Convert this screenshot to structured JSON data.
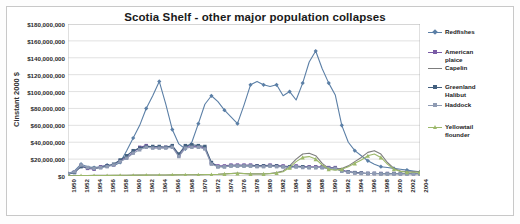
{
  "chart_data": {
    "type": "line",
    "title": "Scotia Shelf - other major population collapses",
    "xlabel": "",
    "ylabel": "Cinstant 2000 $",
    "ylim": [
      0,
      180000000
    ],
    "ytick_labels": [
      "$180,000,000",
      "$160,000,000",
      "$140,000,000",
      "$120,000,000",
      "$100,000,000",
      "$80,000,000",
      "$60,000,000",
      "$40,000,000",
      "$20,000,000",
      "$0"
    ],
    "ytick_values": [
      180000000,
      160000000,
      140000000,
      120000000,
      100000000,
      80000000,
      60000000,
      40000000,
      20000000,
      0
    ],
    "grid": true,
    "legend_position": "right",
    "xtick_labels": [
      "1950",
      "1952",
      "1954",
      "1956",
      "1958",
      "1960",
      "1962",
      "1964",
      "1966",
      "1968",
      "1970",
      "1972",
      "1974",
      "1976",
      "1978",
      "1980",
      "1982",
      "1984",
      "1986",
      "1988",
      "1990",
      "1992",
      "1994",
      "1996",
      "1998",
      "2000",
      "2002",
      "2004"
    ],
    "x": [
      1950,
      1951,
      1952,
      1953,
      1954,
      1955,
      1956,
      1957,
      1958,
      1959,
      1960,
      1961,
      1962,
      1963,
      1964,
      1965,
      1966,
      1967,
      1968,
      1969,
      1970,
      1971,
      1972,
      1973,
      1974,
      1975,
      1976,
      1977,
      1978,
      1979,
      1980,
      1981,
      1982,
      1983,
      1984,
      1985,
      1986,
      1987,
      1988,
      1989,
      1990,
      1991,
      1992,
      1993,
      1994,
      1995,
      1996,
      1997,
      1998,
      1999,
      2000,
      2001,
      2002,
      2003,
      2004
    ],
    "series": [
      {
        "name": "Redfishes",
        "color": "#5b7fa6",
        "marker": "diamond",
        "values": [
          3000000,
          6000000,
          14000000,
          11000000,
          10000000,
          11000000,
          13000000,
          12000000,
          16000000,
          30000000,
          45000000,
          60000000,
          80000000,
          95000000,
          112000000,
          85000000,
          55000000,
          38000000,
          32000000,
          40000000,
          62000000,
          85000000,
          95000000,
          88000000,
          78000000,
          70000000,
          62000000,
          84000000,
          108000000,
          112000000,
          108000000,
          106000000,
          108000000,
          95000000,
          100000000,
          90000000,
          110000000,
          135000000,
          148000000,
          127000000,
          110000000,
          96000000,
          60000000,
          40000000,
          30000000,
          24000000,
          18000000,
          14000000,
          11000000,
          10000000,
          9000000,
          8000000,
          7000000,
          6000000,
          5000000
        ]
      },
      {
        "name": "American plaice",
        "color": "#7a5ba6",
        "marker": "square",
        "values": [
          2000000,
          5000000,
          12000000,
          9000000,
          8000000,
          11000000,
          12000000,
          13000000,
          18000000,
          22000000,
          28000000,
          34000000,
          36000000,
          34000000,
          34000000,
          34000000,
          35000000,
          24000000,
          34000000,
          35000000,
          35000000,
          33000000,
          15000000,
          12000000,
          12000000,
          13000000,
          13000000,
          13000000,
          13000000,
          12000000,
          12000000,
          13000000,
          12000000,
          12000000,
          11000000,
          12000000,
          11000000,
          11000000,
          11000000,
          11000000,
          10000000,
          10000000,
          7000000,
          5000000,
          4000000,
          3500000,
          3000000,
          3000000,
          3000000,
          3000000,
          3000000,
          3000000,
          3000000,
          3000000,
          3000000
        ]
      },
      {
        "name": "Capelin",
        "color": "#7d7d7d",
        "marker": "none",
        "values": [
          500000,
          500000,
          600000,
          600000,
          700000,
          700000,
          800000,
          800000,
          900000,
          900000,
          1000000,
          1000000,
          1100000,
          1100000,
          1200000,
          1200000,
          1300000,
          1400000,
          1500000,
          1500000,
          1600000,
          1700000,
          1800000,
          2000000,
          2500000,
          3000000,
          3500000,
          3000000,
          2500000,
          2500000,
          2500000,
          3000000,
          4000000,
          6000000,
          12000000,
          20000000,
          26000000,
          27000000,
          24000000,
          15000000,
          9000000,
          8000000,
          9000000,
          12000000,
          17000000,
          22000000,
          28000000,
          30000000,
          26000000,
          16000000,
          9000000,
          6000000,
          5000000,
          5000000,
          5000000
        ]
      },
      {
        "name": "Greenland Halibut",
        "color": "#43607f",
        "marker": "square",
        "values": [
          2000000,
          4000000,
          11000000,
          10000000,
          9000000,
          10000000,
          12000000,
          14000000,
          19000000,
          24000000,
          30000000,
          33000000,
          35000000,
          35000000,
          35000000,
          34000000,
          36000000,
          26000000,
          36000000,
          37000000,
          36000000,
          35000000,
          16000000,
          11000000,
          11000000,
          12000000,
          12000000,
          12000000,
          12000000,
          12000000,
          12000000,
          12000000,
          12000000,
          11000000,
          11000000,
          11000000,
          11000000,
          10000000,
          10000000,
          10000000,
          9000000,
          9000000,
          6000000,
          5000000,
          4000000,
          3500000,
          3000000,
          3000000,
          2800000,
          2800000,
          2800000,
          2800000,
          2800000,
          2800000,
          2800000
        ]
      },
      {
        "name": "Haddock",
        "color": "#8f9bb3",
        "marker": "square",
        "values": [
          2500000,
          5000000,
          13000000,
          10000000,
          9000000,
          10000000,
          11000000,
          13000000,
          17000000,
          21000000,
          27000000,
          31000000,
          34000000,
          33000000,
          33000000,
          33000000,
          34000000,
          23000000,
          33000000,
          34000000,
          34000000,
          32000000,
          14000000,
          11000000,
          11000000,
          12000000,
          12000000,
          12000000,
          12000000,
          11000000,
          11000000,
          12000000,
          11000000,
          11000000,
          10000000,
          11000000,
          10000000,
          10000000,
          10000000,
          10000000,
          9000000,
          9000000,
          6000000,
          4500000,
          3500000,
          3000000,
          3000000,
          3000000,
          2500000,
          2500000,
          2500000,
          2500000,
          2500000,
          2500000,
          2500000
        ]
      },
      {
        "name": "Yellowtail flounder",
        "color": "#9cb86a",
        "marker": "triangle",
        "values": [
          300000,
          300000,
          400000,
          400000,
          500000,
          500000,
          600000,
          700000,
          800000,
          800000,
          900000,
          1000000,
          1000000,
          1100000,
          1200000,
          1200000,
          1300000,
          1300000,
          1400000,
          1500000,
          1500000,
          1600000,
          1700000,
          1900000,
          2400000,
          2800000,
          3200000,
          2800000,
          2400000,
          2400000,
          2400000,
          2800000,
          3600000,
          5000000,
          10000000,
          17000000,
          22000000,
          23000000,
          20000000,
          13000000,
          8000000,
          7000000,
          8000000,
          11000000,
          15000000,
          19000000,
          24000000,
          26000000,
          22000000,
          14000000,
          8000000,
          5500000,
          4500000,
          4500000,
          4500000
        ]
      }
    ]
  },
  "legend": {
    "items": [
      {
        "label": "Redfishes",
        "top": 0
      },
      {
        "label": "American\nplaice",
        "top": 20
      },
      {
        "label": "Capelin",
        "top": 36
      },
      {
        "label": "Greenland\nHalibut",
        "top": 55
      },
      {
        "label": "Haddock",
        "top": 73
      },
      {
        "label": "Yellowtail\nflounder",
        "top": 95
      }
    ]
  },
  "colors": {
    "grid": "#d4d4d4",
    "axis": "#b0b0b0",
    "plot_background": "#ffffff",
    "frame_border": "#c8c8c8",
    "title_text": "#1a1a1a",
    "tick_text": "#2a2a2a"
  }
}
